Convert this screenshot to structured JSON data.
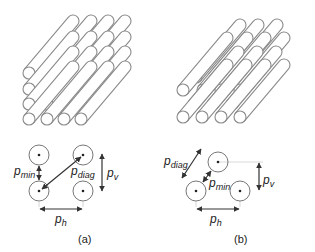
{
  "figure": {
    "panels": [
      {
        "id": "a",
        "caption": "(a)",
        "arrangement": "in-line",
        "labels": {
          "p_min": {
            "base": "p",
            "sub": "min"
          },
          "p_diag": {
            "base": "p",
            "sub": "diag"
          },
          "p_v": {
            "base": "p",
            "sub": "v"
          },
          "p_h": {
            "base": "p",
            "sub": "h"
          }
        }
      },
      {
        "id": "b",
        "caption": "(b)",
        "arrangement": "staggered",
        "labels": {
          "p_diag": {
            "base": "p",
            "sub": "diag"
          },
          "p_min": {
            "base": "p",
            "sub": "min"
          },
          "p_v": {
            "base": "p",
            "sub": "v"
          },
          "p_h": {
            "base": "p",
            "sub": "h"
          }
        }
      }
    ],
    "colors": {
      "tube_stroke": "#8a8a8a",
      "line": "#333333",
      "guide": "#c8c8c8",
      "background": "#ffffff"
    }
  }
}
